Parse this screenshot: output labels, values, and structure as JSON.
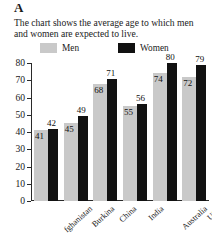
{
  "panel": {
    "letter": "A"
  },
  "caption": {
    "text": "The chart shows the average age to which men and women are expected to live."
  },
  "legend": {
    "men": {
      "label": "Men",
      "color": "#c9c9c9"
    },
    "women": {
      "label": "Women",
      "color": "#111111"
    }
  },
  "axis": {
    "yticks": [
      "0",
      "10",
      "20",
      "30",
      "40",
      "50",
      "60",
      "70",
      "80"
    ]
  },
  "chart_data": {
    "type": "bar",
    "title": "The chart shows the average age to which men and women are expected to live.",
    "xlabel": "",
    "ylabel": "",
    "ylim": [
      0,
      80
    ],
    "ytick_step": 10,
    "grid": false,
    "legend_position": "top",
    "categories": [
      "fghanistan",
      "Burkina",
      "China",
      "India",
      "Australia",
      "USA"
    ],
    "series": [
      {
        "name": "Men",
        "color": "#c9c9c9",
        "values": [
          41,
          45,
          68,
          55,
          74,
          72
        ]
      },
      {
        "name": "Women",
        "color": "#111111",
        "values": [
          42,
          49,
          71,
          56,
          80,
          79
        ]
      }
    ]
  }
}
